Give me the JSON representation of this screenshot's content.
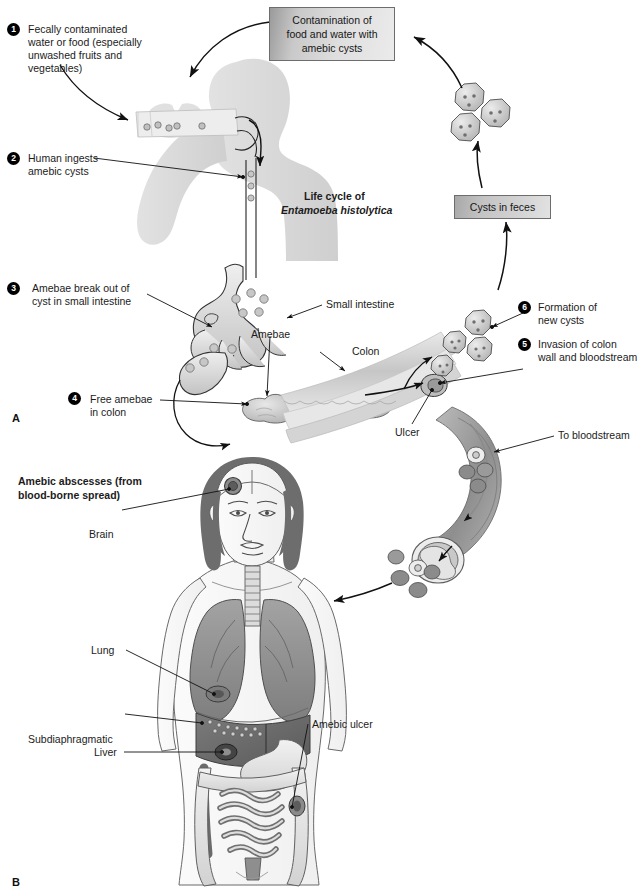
{
  "figure": {
    "panel_a_letter": "A",
    "panel_b_letter": "B",
    "cycle_title_line1": "Life cycle of",
    "cycle_title_line2": "Entamoeba histolytica"
  },
  "boxes": {
    "contamination": "Contamination of\nfood and water with\namebic cysts",
    "cysts_in_feces": "Cysts in feces"
  },
  "steps": [
    {
      "number": "1",
      "text": "Fecally contaminated\nwater or food (especially\nunwashed fruits and\nvegetables)"
    },
    {
      "number": "2",
      "text": "Human ingests\namebic cysts"
    },
    {
      "number": "3",
      "text": "Amebae break out of\ncyst in small intestine"
    },
    {
      "number": "4",
      "text": "Free amebae\nin colon"
    },
    {
      "number": "5",
      "text": "Invasion of colon\nwall and bloodstream"
    },
    {
      "number": "6",
      "text": "Formation of\nnew cysts"
    }
  ],
  "anatomy_labels": {
    "small_intestine": "Small intestine",
    "amebae": "Amebae",
    "colon": "Colon",
    "ulcer": "Ulcer",
    "to_bloodstream": "To bloodstream"
  },
  "abscess_panel": {
    "heading": "Amebic abscesses (from\nblood-borne spread)",
    "labels": {
      "brain": "Brain",
      "lung": "Lung",
      "subdiaphragmatic": "Subdiaphragmatic",
      "liver": "Liver",
      "amebic_ulcer": "Amebic ulcer"
    }
  },
  "colors": {
    "ink": "#1b1b1b",
    "silhouette": "#d9d9d9",
    "organ_mid": "#9a9a9a",
    "organ_dark": "#6f6f6f",
    "organ_light": "#d2d2d2",
    "vessel": "#9d9d9d",
    "liver": "#6a6a6a",
    "lung": "#8e8e8e",
    "hair": "#6b6b6b",
    "skin": "#f4f4f4",
    "box_border": "#6d6d6d"
  }
}
